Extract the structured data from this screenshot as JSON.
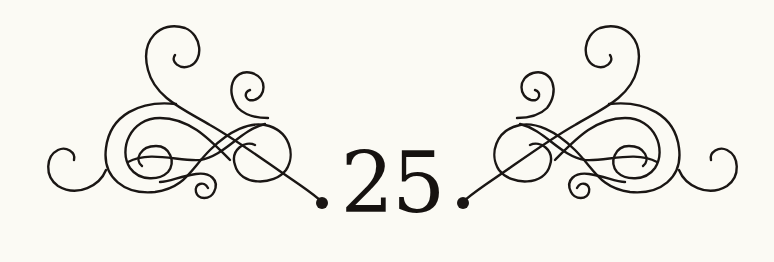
{
  "page": {
    "number": "25",
    "background_color": "#fbfaf4",
    "ink_color": "#1a1614"
  },
  "ornaments": [
    {
      "name": "left-flourish",
      "icon": "calligraphic-flourish"
    },
    {
      "name": "right-flourish",
      "icon": "calligraphic-flourish-mirrored"
    }
  ]
}
